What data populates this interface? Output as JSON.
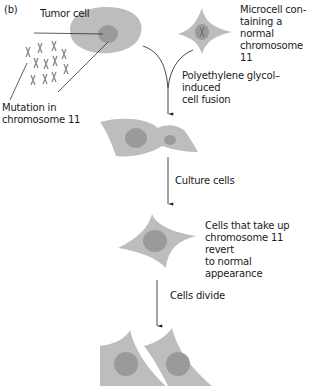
{
  "panel_label": "(b)",
  "labels": {
    "tumor_cell": "Tumor cell",
    "mutation": "Mutation in\nchromosome 11",
    "microcell": "Microcell con-\ntaining a normal\nchromosome 11",
    "fusion_step": "Polyethylene glycol–induced\ncell fusion",
    "culture_step": "Culture cells",
    "revert": "Cells that take up\nchromosome 11 revert\nto normal appearance",
    "divide_step": "Cells divide"
  },
  "colors": {
    "cell_body": "#bdbdbd",
    "nucleus": "#9a9a9a",
    "chromosome": "#8a8a8a",
    "line": "#1a1a1a",
    "background": "#ffffff"
  },
  "stages": [
    {
      "name": "tumor-cell-and-microcell"
    },
    {
      "name": "fused-cell"
    },
    {
      "name": "reverted-cell"
    },
    {
      "name": "divided-cells"
    }
  ]
}
